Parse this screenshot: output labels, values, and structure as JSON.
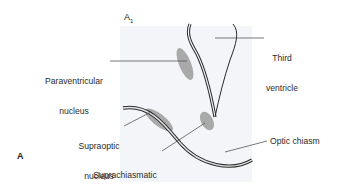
{
  "figure": {
    "panel_letter": "A",
    "subpanel_label": "A",
    "subpanel_subscript": "1"
  },
  "labels": {
    "paraventricular": {
      "line1": "Paraventricular",
      "line2": "nucleus"
    },
    "third_ventricle": {
      "line1": "Third",
      "line2": "ventricle"
    },
    "supraoptic": {
      "line1": "Supraoptic",
      "line2": "nucleus"
    },
    "suprachiasmatic": {
      "line1": "Suprachiasmatic",
      "line2": "nucleus"
    },
    "optic_chiasm": "Optic chiasm"
  },
  "colors": {
    "background": "#ffffff",
    "panel_shade": "#f3f4f7",
    "nucleus_fill": "#a9a9a9",
    "outline": "#2a2a2a",
    "leader_line": "#555555"
  }
}
